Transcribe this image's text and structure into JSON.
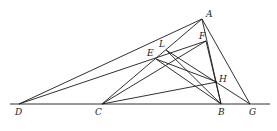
{
  "diagram": {
    "type": "geometric-construction",
    "stroke_color": "#1a1a1a",
    "points": {
      "A": {
        "x": 202,
        "y": 19,
        "label": "A",
        "lx": 206,
        "ly": 10
      },
      "F": {
        "x": 206,
        "y": 41,
        "label": "F",
        "lx": 199,
        "ly": 32
      },
      "L": {
        "x": 166,
        "y": 50,
        "label": "L",
        "lx": 159,
        "ly": 40
      },
      "E": {
        "x": 156,
        "y": 59,
        "label": "E",
        "lx": 147,
        "ly": 49
      },
      "H": {
        "x": 217,
        "y": 82,
        "label": "H",
        "lx": 219,
        "ly": 75
      },
      "D": {
        "x": 19,
        "y": 104,
        "label": "D",
        "lx": 15,
        "ly": 108
      },
      "C": {
        "x": 102,
        "y": 104,
        "label": "C",
        "lx": 95,
        "ly": 108
      },
      "B": {
        "x": 221,
        "y": 104,
        "label": "B",
        "lx": 218,
        "ly": 108
      },
      "G": {
        "x": 250,
        "y": 104,
        "label": "G",
        "lx": 249,
        "ly": 108
      }
    },
    "baseline": {
      "x1": 10,
      "x2": 270,
      "y": 104
    },
    "segments": [
      [
        "D",
        "A"
      ],
      [
        "D",
        "F"
      ],
      [
        "C",
        "A"
      ],
      [
        "C",
        "F"
      ],
      [
        "C",
        "H"
      ],
      [
        "A",
        "B"
      ],
      [
        "A",
        "G"
      ],
      [
        "E",
        "B"
      ],
      [
        "L",
        "B"
      ],
      [
        "L",
        "G"
      ],
      [
        "E",
        "H"
      ],
      [
        "F",
        "B"
      ]
    ]
  }
}
